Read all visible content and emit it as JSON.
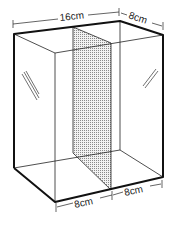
{
  "diagram": {
    "type": "box-with-partition",
    "labels": {
      "top_width": "16cm",
      "top_depth": "8cm",
      "bottom_left": "8cm",
      "bottom_right": "8cm"
    },
    "colors": {
      "line": "#111111",
      "partition_fill": "#cfcfcf",
      "background": "#ffffff"
    }
  }
}
